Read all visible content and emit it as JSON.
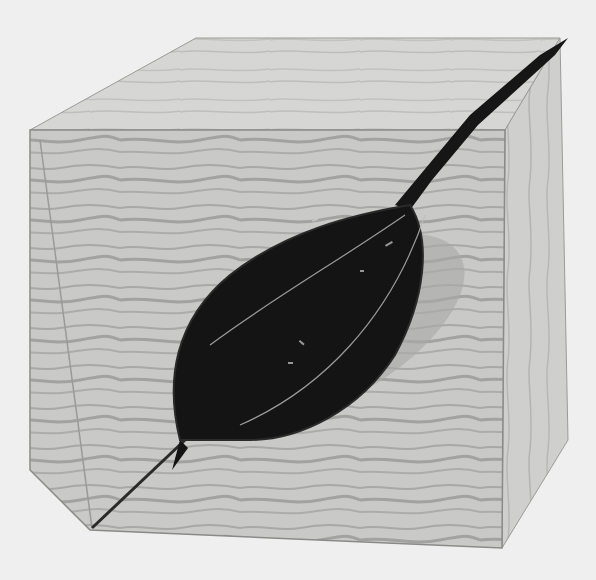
{
  "image": {
    "kind": "photograph",
    "subject": "plywood cube sculpture with a dark leaf-shaped form along the diagonal",
    "tone": "grayscale",
    "colors": {
      "background": "#efefef",
      "top_face": "#d6d6d4",
      "front_face": "#c9c9c7",
      "side_face": "#cfcfcd",
      "wood_grain": "#9e9e9c",
      "edge_line": "#8a8a88",
      "leaf": "#141414",
      "leaf_vein": "#bdbdbd"
    }
  }
}
